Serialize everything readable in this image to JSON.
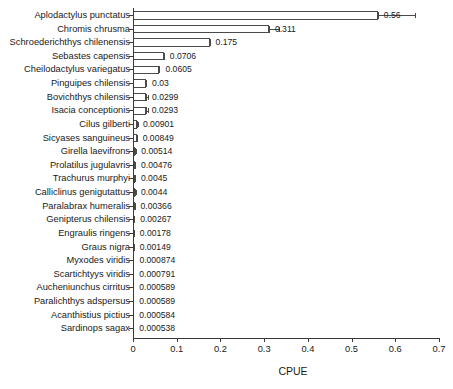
{
  "chart_data": {
    "type": "bar",
    "orientation": "horizontal",
    "title": "",
    "xlabel": "CPUE",
    "ylabel": "",
    "xlim": [
      0,
      0.7
    ],
    "xticks": [
      "0",
      "0.1",
      "0.2",
      "0.3",
      "0.4",
      "0.5",
      "0.6",
      "0.7"
    ],
    "xtick_values": [
      0,
      0.1,
      0.2,
      0.3,
      0.4,
      0.5,
      0.6,
      0.7
    ],
    "grid": false,
    "legend": null,
    "categories": [
      "Aplodactylus punctatus",
      "Chromis chrusma",
      "Schroederichthys chilenensis",
      "Sebastes capensis",
      "Cheilodactylus variegatus",
      "Pinguipes chilensis",
      "Bovichthys chilensis",
      "Isacia conceptionis",
      "Cilus gilberti",
      "Sicyases sanguineus",
      "Girella laevifrons",
      "Prolatilus jugulavris",
      "Trachurus murphyi",
      "Calliclinus genigutattus",
      "Paralabrax humeralis",
      "Genipterus chilensis",
      "Engraulis ringens",
      "Graus nigra",
      "Myxodes viridis",
      "Scartichtyys viridis",
      "Aucheniunchus cirritus",
      "Paralichthys adspersus",
      "Acanthistius pictius",
      "Sardinops sagax"
    ],
    "values": [
      0.56,
      0.311,
      0.175,
      0.0706,
      0.0605,
      0.03,
      0.0299,
      0.0293,
      0.00901,
      0.00849,
      0.00514,
      0.00476,
      0.0045,
      0.0044,
      0.00366,
      0.00267,
      0.00178,
      0.00149,
      0.000874,
      0.000791,
      0.000589,
      0.000589,
      0.000584,
      0.000538
    ],
    "value_labels": [
      "0.56",
      "0.311",
      "0.175",
      "0.0706",
      "0.0605",
      "0.03",
      "0.0299",
      "0.0293",
      "0.00901",
      "0.00849",
      "0.00514",
      "0.00476",
      "0.0045",
      "0.0044",
      "0.00366",
      "0.00267",
      "0.00178",
      "0.00149",
      "0.000874",
      "0.000791",
      "0.000589",
      "0.000589",
      "0.000584",
      "0.000538"
    ],
    "errors_upper": [
      0.085,
      0.022,
      0.0,
      0.0,
      0.0,
      0.0,
      0.004,
      0.006,
      0.002,
      0.0,
      0.001,
      0.0008,
      0.0008,
      0.0015,
      0.002,
      0.0,
      0.0,
      0.0,
      0.0,
      0.0,
      0.0,
      0.0,
      0.0,
      0.0
    ],
    "colors": {
      "bar_fill": "#ffffff",
      "bar_edge": "#4a4a4a",
      "axis": "#3a3a3a",
      "text": "#1a1a1a",
      "background": "#ffffff"
    }
  }
}
